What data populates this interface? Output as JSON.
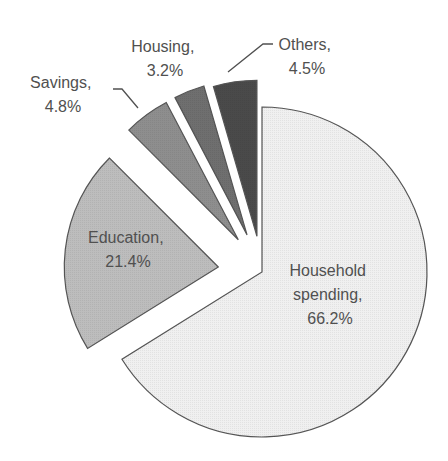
{
  "chart_data": {
    "type": "pie",
    "title": "",
    "exploded": true,
    "slices": [
      {
        "label": "Household spending",
        "value": 66.2,
        "color": "#f0f0f0"
      },
      {
        "label": "Education",
        "value": 21.4,
        "color": "#bdbdbd"
      },
      {
        "label": "Savings",
        "value": 4.8,
        "color": "#8e8e8e"
      },
      {
        "label": "Housing",
        "value": 3.2,
        "color": "#6f6f6f"
      },
      {
        "label": "Others",
        "value": 4.5,
        "color": "#4a4a4a"
      }
    ],
    "labels": {
      "household_line1": "Household",
      "household_line2": "spending,",
      "household_line3": "66.2%",
      "education_line1": "Education,",
      "education_line2": "21.4%",
      "savings_line1": "Savings,",
      "savings_line2": "4.8%",
      "housing_line1": "Housing,",
      "housing_line2": "3.2%",
      "others_line1": "Others,",
      "others_line2": "4.5%"
    },
    "legend": "none",
    "grid": false
  }
}
